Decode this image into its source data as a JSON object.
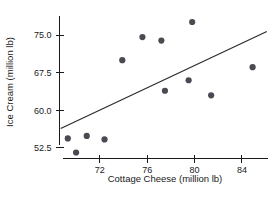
{
  "chart_data": {
    "type": "scatter",
    "title": "",
    "xlabel": "Cottage Cheese (million lb)",
    "ylabel": "Ice Cream (million lb)",
    "xlim": [
      68.6,
      86.2
    ],
    "ylim": [
      50.4,
      78.8
    ],
    "xticks": [
      72,
      76,
      80,
      84
    ],
    "xtick_labels": [
      "72",
      "76",
      "80",
      "84"
    ],
    "yticks": [
      52.5,
      60.0,
      67.5,
      75.0
    ],
    "ytick_labels": [
      "52.5",
      "60.0",
      "67.5",
      "75.0"
    ],
    "grid": false,
    "legend": null,
    "point_color": "#4a4a52",
    "line_color": "#2a2a2a",
    "series": [
      {
        "name": "observations",
        "x": [
          69.3,
          70.0,
          70.9,
          72.4,
          73.9,
          75.6,
          77.2,
          77.5,
          79.5,
          79.8,
          81.4,
          84.9
        ],
        "y": [
          54.4,
          51.6,
          54.9,
          54.2,
          70.0,
          74.6,
          73.9,
          63.9,
          66.0,
          77.6,
          63.0,
          68.6
        ]
      }
    ],
    "trend_line": {
      "name": "fitted regression line",
      "x": [
        68.7,
        86.1
      ],
      "y": [
        56.4,
        75.7
      ]
    }
  },
  "axis_titles": {
    "x": "Cottage Cheese (million lb)",
    "y": "Ice Cream (million lb)"
  }
}
